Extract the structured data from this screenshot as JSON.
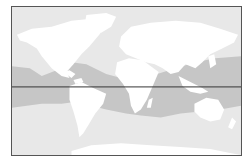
{
  "map": {
    "title": "World map showing tropical zone",
    "colors": {
      "ocean": "#e8e8e8",
      "land": "#ffffff",
      "tropical_band": "#c6c6c6",
      "equator_line": "#333333",
      "frame": "#555555"
    },
    "features": [
      {
        "name": "equator",
        "type": "line"
      },
      {
        "name": "tropical-ocean-zone",
        "type": "shaded-region"
      }
    ]
  }
}
